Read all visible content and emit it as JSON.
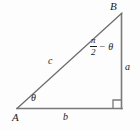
{
  "figure": {
    "type": "right-triangle-diagram",
    "background_color": "#fdfdfd",
    "stroke_color": "#6e6e6e",
    "text_color": "#1b1b1b",
    "vertices": {
      "A": {
        "label": "A",
        "x": 17,
        "y": 108
      },
      "B": {
        "label": "B",
        "x": 122,
        "y": 14
      },
      "C": {
        "label": "",
        "x": 122,
        "y": 108
      }
    },
    "sides": {
      "hypotenuse": {
        "label": "c",
        "from": "A",
        "to": "B"
      },
      "vertical": {
        "label": "a",
        "from": "B",
        "to": "C"
      },
      "horizontal": {
        "label": "b",
        "from": "A",
        "to": "C"
      }
    },
    "angles": {
      "at_A": {
        "label": "θ"
      },
      "at_B": {
        "numerator": "π",
        "denominator": "2",
        "operator": "−",
        "term": "θ"
      },
      "at_C": {
        "label": "right-angle-marker"
      }
    }
  }
}
